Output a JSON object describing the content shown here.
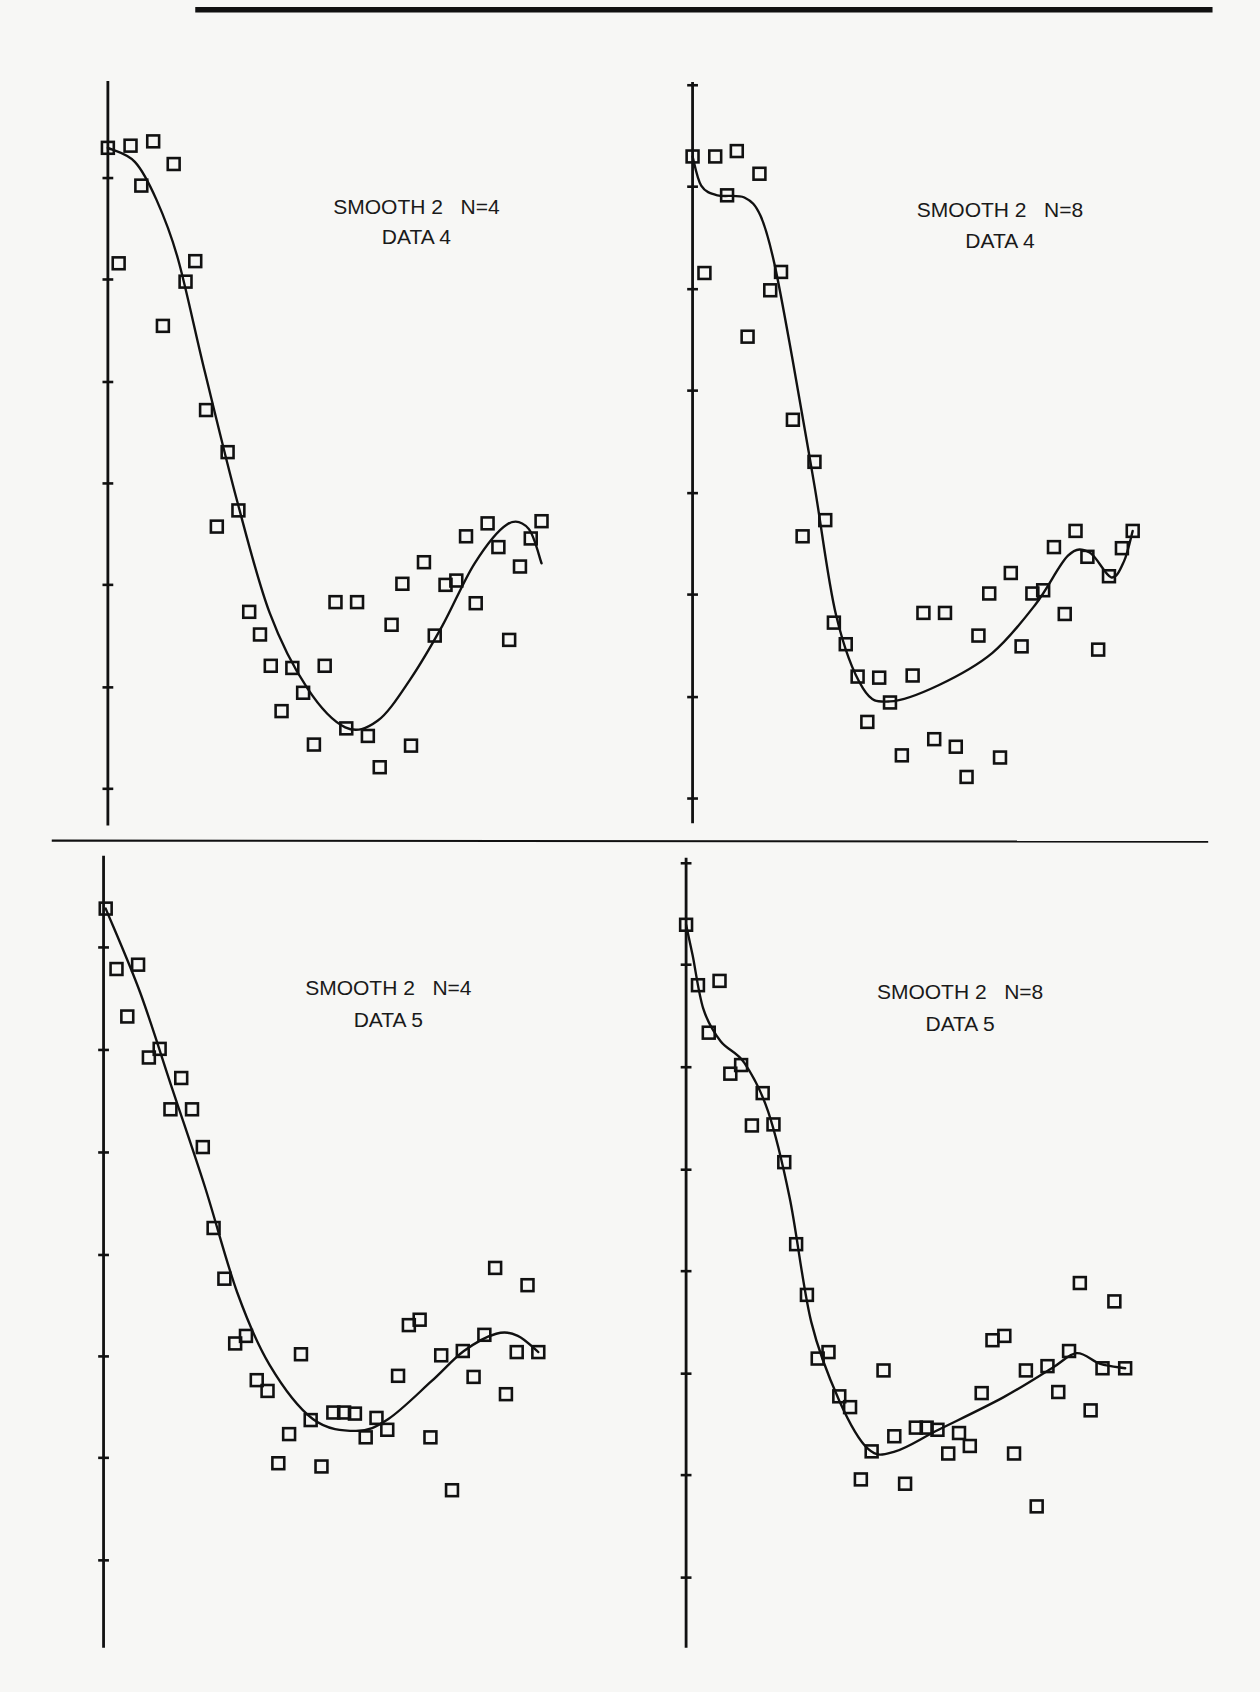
{
  "page": {
    "background": "#f7f7f5",
    "ink": "#111111",
    "top_rule": {
      "x1": 181,
      "x2": 1124,
      "y": 9,
      "thickness": 5
    },
    "divider_rule": {
      "x1": 48,
      "x2": 1120,
      "y": 779,
      "thickness": 2
    }
  },
  "chart_data": [
    {
      "type": "scatter",
      "title": "SMOOTH 2   N=4",
      "subtitle": "DATA 4",
      "xlabel": "",
      "ylabel": "",
      "grid": false,
      "legend": null,
      "marker": "open-square",
      "axis": {
        "x": 100,
        "y_top": 75,
        "y_bottom": 765,
        "ticks": [
          165,
          259,
          354,
          448,
          542,
          637,
          731
        ]
      },
      "label_pos": {
        "x": 386,
        "y1": 198,
        "y2": 226
      },
      "points": [
        [
          100,
          137
        ],
        [
          121,
          135
        ],
        [
          142,
          131
        ],
        [
          161,
          152
        ],
        [
          131,
          172
        ],
        [
          110,
          244
        ],
        [
          181,
          242
        ],
        [
          172,
          261
        ],
        [
          151,
          302
        ],
        [
          191,
          380
        ],
        [
          211,
          419
        ],
        [
          201,
          488
        ],
        [
          221,
          473
        ],
        [
          231,
          567
        ],
        [
          241,
          588
        ],
        [
          251,
          617
        ],
        [
          271,
          619
        ],
        [
          301,
          617
        ],
        [
          281,
          642
        ],
        [
          261,
          659
        ],
        [
          291,
          690
        ],
        [
          311,
          558
        ],
        [
          331,
          558
        ],
        [
          363,
          579
        ],
        [
          321,
          675
        ],
        [
          341,
          682
        ],
        [
          352,
          711
        ],
        [
          381,
          691
        ],
        [
          373,
          541
        ],
        [
          393,
          521
        ],
        [
          403,
          589
        ],
        [
          413,
          542
        ],
        [
          423,
          538
        ],
        [
          432,
          497
        ],
        [
          441,
          559
        ],
        [
          452,
          485
        ],
        [
          462,
          507
        ],
        [
          472,
          593
        ],
        [
          482,
          525
        ],
        [
          492,
          499
        ],
        [
          502,
          483
        ]
      ],
      "smooth_curve": [
        [
          100,
          137
        ],
        [
          125,
          150
        ],
        [
          145,
          185
        ],
        [
          165,
          240
        ],
        [
          190,
          345
        ],
        [
          220,
          465
        ],
        [
          250,
          568
        ],
        [
          285,
          638
        ],
        [
          320,
          674
        ],
        [
          350,
          668
        ],
        [
          380,
          630
        ],
        [
          410,
          580
        ],
        [
          440,
          522
        ],
        [
          470,
          486
        ],
        [
          490,
          490
        ],
        [
          502,
          522
        ]
      ]
    },
    {
      "type": "scatter",
      "title": "SMOOTH 2   N=8",
      "subtitle": "DATA 4",
      "xlabel": "",
      "ylabel": "",
      "grid": false,
      "legend": null,
      "marker": "open-square",
      "axis": {
        "x": 642,
        "y_top": 76,
        "y_bottom": 763,
        "ticks": [
          79,
          173,
          268,
          362,
          457,
          551,
          646,
          740
        ]
      },
      "label_pos": {
        "x": 927,
        "y1": 201,
        "y2": 230
      },
      "points": [
        [
          642,
          145
        ],
        [
          663,
          145
        ],
        [
          683,
          140
        ],
        [
          704,
          161
        ],
        [
          674,
          181
        ],
        [
          653,
          253
        ],
        [
          724,
          252
        ],
        [
          714,
          269
        ],
        [
          693,
          312
        ],
        [
          735,
          389
        ],
        [
          755,
          428
        ],
        [
          744,
          497
        ],
        [
          765,
          482
        ],
        [
          773,
          577
        ],
        [
          784,
          597
        ],
        [
          795,
          627
        ],
        [
          815,
          628
        ],
        [
          846,
          626
        ],
        [
          825,
          651
        ],
        [
          804,
          669
        ],
        [
          836,
          700
        ],
        [
          856,
          568
        ],
        [
          876,
          568
        ],
        [
          866,
          685
        ],
        [
          886,
          692
        ],
        [
          896,
          720
        ],
        [
          927,
          702
        ],
        [
          917,
          550
        ],
        [
          937,
          531
        ],
        [
          907,
          589
        ],
        [
          947,
          599
        ],
        [
          957,
          550
        ],
        [
          967,
          547
        ],
        [
          977,
          507
        ],
        [
          987,
          569
        ],
        [
          997,
          492
        ],
        [
          1008,
          516
        ],
        [
          1018,
          602
        ],
        [
          1028,
          534
        ],
        [
          1040,
          508
        ],
        [
          1050,
          492
        ]
      ],
      "smooth_curve": [
        [
          642,
          145
        ],
        [
          650,
          172
        ],
        [
          665,
          181
        ],
        [
          690,
          183
        ],
        [
          705,
          200
        ],
        [
          718,
          245
        ],
        [
          735,
          335
        ],
        [
          755,
          450
        ],
        [
          775,
          570
        ],
        [
          800,
          638
        ],
        [
          825,
          650
        ],
        [
          870,
          635
        ],
        [
          920,
          605
        ],
        [
          960,
          560
        ],
        [
          990,
          515
        ],
        [
          1010,
          512
        ],
        [
          1030,
          535
        ],
        [
          1042,
          520
        ],
        [
          1050,
          492
        ]
      ]
    },
    {
      "type": "scatter",
      "title": "SMOOTH 2   N=4",
      "subtitle": "DATA 5",
      "xlabel": "",
      "ylabel": "",
      "grid": false,
      "legend": null,
      "marker": "open-square",
      "axis": {
        "x": 96,
        "y_top": 793,
        "y_bottom": 1527,
        "ticks": [
          878,
          973,
          1068,
          1163,
          1257,
          1351,
          1446
        ]
      },
      "label_pos": {
        "x": 360,
        "y1": 922,
        "y2": 952
      },
      "points": [
        [
          98,
          842
        ],
        [
          108,
          898
        ],
        [
          128,
          894
        ],
        [
          118,
          942
        ],
        [
          138,
          980
        ],
        [
          148,
          972
        ],
        [
          168,
          999
        ],
        [
          158,
          1028
        ],
        [
          178,
          1028
        ],
        [
          188,
          1063
        ],
        [
          198,
          1138
        ],
        [
          208,
          1185
        ],
        [
          218,
          1245
        ],
        [
          228,
          1238
        ],
        [
          238,
          1279
        ],
        [
          248,
          1289
        ],
        [
          279,
          1255
        ],
        [
          268,
          1329
        ],
        [
          258,
          1356
        ],
        [
          288,
          1316
        ],
        [
          298,
          1359
        ],
        [
          309,
          1309
        ],
        [
          319,
          1309
        ],
        [
          329,
          1310
        ],
        [
          339,
          1332
        ],
        [
          349,
          1314
        ],
        [
          359,
          1325
        ],
        [
          369,
          1275
        ],
        [
          379,
          1228
        ],
        [
          389,
          1223
        ],
        [
          399,
          1332
        ],
        [
          409,
          1256
        ],
        [
          419,
          1381
        ],
        [
          429,
          1252
        ],
        [
          439,
          1276
        ],
        [
          449,
          1237
        ],
        [
          459,
          1175
        ],
        [
          469,
          1292
        ],
        [
          479,
          1253
        ],
        [
          489,
          1191
        ],
        [
          499,
          1253
        ]
      ],
      "smooth_curve": [
        [
          98,
          842
        ],
        [
          130,
          920
        ],
        [
          160,
          1010
        ],
        [
          190,
          1100
        ],
        [
          220,
          1198
        ],
        [
          250,
          1265
        ],
        [
          290,
          1315
        ],
        [
          330,
          1326
        ],
        [
          360,
          1315
        ],
        [
          400,
          1280
        ],
        [
          430,
          1252
        ],
        [
          460,
          1236
        ],
        [
          480,
          1238
        ],
        [
          499,
          1253
        ]
      ]
    },
    {
      "type": "scatter",
      "title": "SMOOTH 2   N=8",
      "subtitle": "DATA 5",
      "xlabel": "",
      "ylabel": "",
      "grid": false,
      "legend": null,
      "marker": "open-square",
      "axis": {
        "x": 636,
        "y_top": 795,
        "y_bottom": 1527,
        "ticks": [
          800,
          894,
          989,
          1084,
          1178,
          1273,
          1367,
          1462
        ]
      },
      "label_pos": {
        "x": 890,
        "y1": 926,
        "y2": 955
      },
      "points": [
        [
          636,
          857
        ],
        [
          647,
          913
        ],
        [
          667,
          909
        ],
        [
          657,
          957
        ],
        [
          677,
          995
        ],
        [
          687,
          987
        ],
        [
          707,
          1013
        ],
        [
          697,
          1043
        ],
        [
          717,
          1042
        ],
        [
          727,
          1077
        ],
        [
          738,
          1153
        ],
        [
          748,
          1200
        ],
        [
          758,
          1259
        ],
        [
          768,
          1253
        ],
        [
          778,
          1294
        ],
        [
          788,
          1304
        ],
        [
          819,
          1270
        ],
        [
          808,
          1345
        ],
        [
          798,
          1371
        ],
        [
          829,
          1331
        ],
        [
          839,
          1375
        ],
        [
          849,
          1323
        ],
        [
          859,
          1323
        ],
        [
          869,
          1325
        ],
        [
          879,
          1347
        ],
        [
          889,
          1328
        ],
        [
          899,
          1340
        ],
        [
          910,
          1291
        ],
        [
          920,
          1242
        ],
        [
          931,
          1238
        ],
        [
          940,
          1347
        ],
        [
          951,
          1270
        ],
        [
          961,
          1396
        ],
        [
          971,
          1266
        ],
        [
          981,
          1290
        ],
        [
          991,
          1252
        ],
        [
          1001,
          1189
        ],
        [
          1011,
          1307
        ],
        [
          1022,
          1268
        ],
        [
          1033,
          1206
        ],
        [
          1043,
          1268
        ]
      ],
      "smooth_curve": [
        [
          636,
          857
        ],
        [
          642,
          885
        ],
        [
          652,
          935
        ],
        [
          668,
          965
        ],
        [
          690,
          985
        ],
        [
          712,
          1030
        ],
        [
          732,
          1110
        ],
        [
          752,
          1225
        ],
        [
          778,
          1298
        ],
        [
          805,
          1343
        ],
        [
          830,
          1345
        ],
        [
          870,
          1325
        ],
        [
          930,
          1295
        ],
        [
          975,
          1268
        ],
        [
          998,
          1254
        ],
        [
          1020,
          1264
        ],
        [
          1043,
          1268
        ]
      ]
    }
  ]
}
